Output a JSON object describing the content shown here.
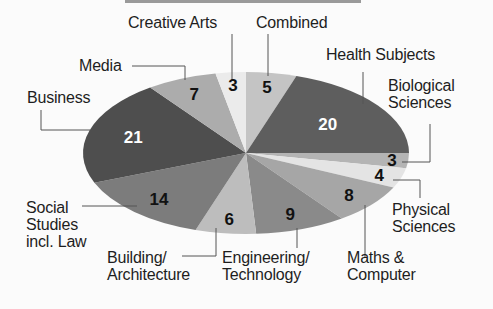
{
  "chart_data": {
    "type": "pie",
    "title": "",
    "unit": "percent",
    "categories": [
      "Combined",
      "Health Subjects",
      "Biological Sciences",
      "Physical Sciences",
      "Maths & Computer",
      "Engineering/Technology",
      "Building/Architecture",
      "Social Studies incl. Law",
      "Business",
      "Media",
      "Creative Arts"
    ],
    "values": [
      5,
      20,
      3,
      4,
      8,
      9,
      6,
      14,
      21,
      7,
      3
    ],
    "data_labels": [
      "5",
      "20",
      "3",
      "4",
      "8",
      "9",
      "6",
      "14",
      "21",
      "7",
      "3"
    ],
    "start_angle": "top, clockwise",
    "legend_position": "outside labels with leader lines"
  },
  "style": {
    "fills": [
      "#c4c4c4",
      "#5e5e5e",
      "#b4b4b4",
      "#e4e4e4",
      "#a6a6a6",
      "#8a8a8a",
      "#bdbdbd",
      "#7c7c7c",
      "#4e4e4e",
      "#acacac",
      "#ebebeb"
    ],
    "value_colors": [
      "#111111",
      "#ffffff",
      "#111111",
      "#111111",
      "#111111",
      "#111111",
      "#111111",
      "#111111",
      "#ffffff",
      "#111111",
      "#111111"
    ]
  },
  "labels": {
    "combined": "Combined",
    "health": "Health Subjects",
    "biological": "Biological\nSciences",
    "physical": "Physical\nSciences",
    "maths": "Maths &\nComputer",
    "engineering": "Engineering/\nTechnology",
    "building": "Building/\nArchitecture",
    "social": "Social\nStudies\nincl. Law",
    "business": "Business",
    "media": "Media",
    "creative": "Creative Arts"
  }
}
